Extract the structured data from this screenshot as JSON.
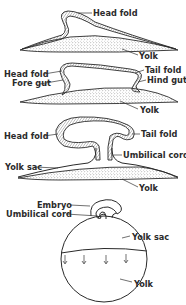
{
  "figure": {
    "type": "embryonic folding diagram",
    "stages": [
      {
        "id": "stage1",
        "labels": [
          "Head fold",
          "Yolk"
        ]
      },
      {
        "id": "stage2",
        "labels": [
          "Head fold",
          "Fore gut",
          "Tail fold",
          "Hind gut",
          "Yolk"
        ]
      },
      {
        "id": "stage3",
        "labels": [
          "Head fold",
          "Tail fold",
          "Umbilical cord",
          "Yolk sac",
          "Yolk"
        ]
      },
      {
        "id": "stage4",
        "labels": [
          "Embryo",
          "Umbilical cord",
          "Yolk sac",
          "Yolk"
        ]
      }
    ]
  },
  "labels": {
    "s1_head_fold": "Head fold",
    "s1_yolk": "Yolk",
    "s2_head_fold": "Head fold",
    "s2_fore_gut": "Fore gut",
    "s2_tail_fold": "Tail fold",
    "s2_hind_gut": "Hind gut",
    "s2_yolk": "Yolk",
    "s3_head_fold": "Head fold",
    "s3_tail_fold": "Tail fold",
    "s3_umbilical_cord": "Umbilical cord",
    "s3_yolk_sac": "Yolk sac",
    "s3_yolk": "Yolk",
    "s4_embryo": "Embryo",
    "s4_umbilical_cord": "Umbilical cord",
    "s4_yolk_sac": "Yolk sac",
    "s4_yolk": "Yolk"
  },
  "colors": {
    "ink": "#2a2a2a",
    "stipple": "#7a7a7a",
    "background": "#ffffff"
  }
}
